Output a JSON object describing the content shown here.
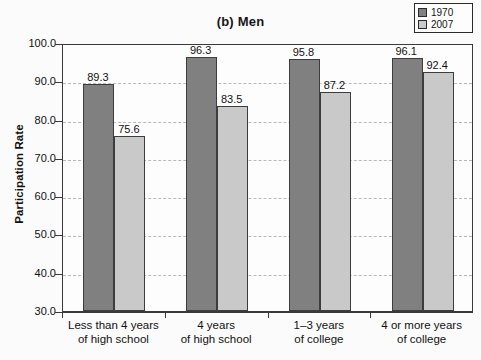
{
  "chart_data": {
    "type": "bar",
    "title": "(b) Men",
    "xlabel": "",
    "ylabel": "Participation Rate",
    "ylim": [
      30.0,
      100.0
    ],
    "ytick_labels": [
      "100.0",
      "90.0",
      "80.0",
      "70.0",
      "60.0",
      "50.0",
      "40.0",
      "30.0"
    ],
    "yticks": [
      100.0,
      90.0,
      80.0,
      70.0,
      60.0,
      50.0,
      40.0,
      30.0
    ],
    "grid": true,
    "legend_position": "top-right",
    "categories": [
      "Less than 4 years\nof high school",
      "4 years\nof high school",
      "1–3 years\nof college",
      "4 or more years\nof college"
    ],
    "category_lines": [
      [
        "Less than 4 years",
        "of high school"
      ],
      [
        "4 years",
        "of high school"
      ],
      [
        "1–3 years",
        "of college"
      ],
      [
        "4 or more years",
        "of college"
      ]
    ],
    "series": [
      {
        "name": "1970",
        "color": "#808080",
        "values": [
          89.3,
          96.3,
          95.8,
          96.1
        ],
        "value_labels": [
          "89.3",
          "96.3",
          "95.8",
          "96.1"
        ]
      },
      {
        "name": "2007",
        "color": "#c9c9c9",
        "values": [
          75.6,
          83.5,
          87.2,
          92.4
        ],
        "value_labels": [
          "75.6",
          "83.5",
          "87.2",
          "92.4"
        ]
      }
    ]
  },
  "legend": {
    "entries": [
      {
        "label": "1970",
        "color": "#808080"
      },
      {
        "label": "2007",
        "color": "#c9c9c9"
      }
    ]
  }
}
